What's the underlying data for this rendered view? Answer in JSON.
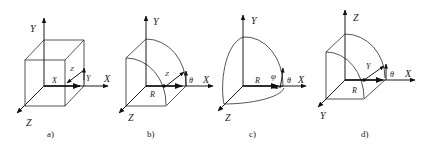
{
  "figure": {
    "panels": [
      {
        "id": "a",
        "caption": "a)",
        "shape": "cube",
        "axis_labels": {
          "vertical": "Y",
          "horizontal": "X",
          "depth": "Z"
        },
        "inner_labels": {
          "x": "X",
          "y": "Y",
          "z": "Z"
        }
      },
      {
        "id": "b",
        "caption": "b)",
        "shape": "cylinder-sector",
        "axis_labels": {
          "vertical": "Y",
          "horizontal": "X",
          "depth": "Z"
        },
        "inner_labels": {
          "r": "R",
          "z": "Z",
          "theta": "θ"
        }
      },
      {
        "id": "c",
        "caption": "c)",
        "shape": "sphere-octant",
        "axis_labels": {
          "vertical": "Y",
          "horizontal": "X",
          "depth": "Z"
        },
        "inner_labels": {
          "r": "R",
          "phi": "φ",
          "theta": "θ"
        }
      },
      {
        "id": "d",
        "caption": "d)",
        "shape": "cylinder-sector",
        "axis_labels": {
          "vertical": "Z",
          "horizontal": "X",
          "depth": "Y"
        },
        "inner_labels": {
          "r": "R",
          "y": "Y",
          "theta": "θ"
        }
      }
    ]
  }
}
